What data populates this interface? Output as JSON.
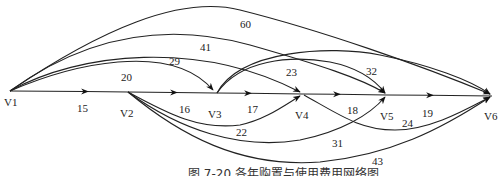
{
  "caption": "图 7-20  各年购置与使用费用网络图",
  "nodes": [
    {
      "id": "V1",
      "label": "V1"
    },
    {
      "id": "V2",
      "label": "V2"
    },
    {
      "id": "V3",
      "label": "V3"
    },
    {
      "id": "V4",
      "label": "V4"
    },
    {
      "id": "V5",
      "label": "V5"
    },
    {
      "id": "V6",
      "label": "V6"
    }
  ],
  "edges": [
    {
      "from": "V1",
      "to": "V2",
      "weight": "15"
    },
    {
      "from": "V2",
      "to": "V3",
      "weight": "16"
    },
    {
      "from": "V3",
      "to": "V4",
      "weight": "17"
    },
    {
      "from": "V4",
      "to": "V5",
      "weight": "18"
    },
    {
      "from": "V5",
      "to": "V6",
      "weight": "19"
    },
    {
      "from": "V1",
      "to": "V3",
      "weight": "20"
    },
    {
      "from": "V1",
      "to": "V4",
      "weight": "29"
    },
    {
      "from": "V1",
      "to": "V5",
      "weight": "41"
    },
    {
      "from": "V1",
      "to": "V6",
      "weight": "60"
    },
    {
      "from": "V2",
      "to": "V4",
      "weight": "22"
    },
    {
      "from": "V2",
      "to": "V5",
      "weight": "31"
    },
    {
      "from": "V2",
      "to": "V6",
      "weight": "43"
    },
    {
      "from": "V3",
      "to": "V5",
      "weight": "23"
    },
    {
      "from": "V3",
      "to": "V6",
      "weight": "32"
    },
    {
      "from": "V4",
      "to": "V6",
      "weight": "24"
    }
  ]
}
